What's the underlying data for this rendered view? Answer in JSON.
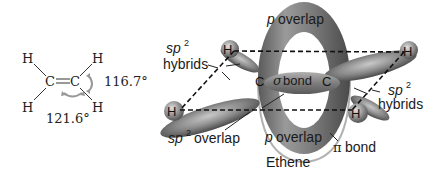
{
  "left_structure": {
    "atoms": {
      "h_top_left": "H",
      "h_top_right": "H",
      "h_bottom_left": "H",
      "h_bottom_right": "H",
      "c_left": "C",
      "c_right": "C"
    },
    "angle_hch": "116.7°",
    "angle_hcc": "121.6°"
  },
  "orbital_model": {
    "title": "Ethene",
    "labels": {
      "p_overlap_top": "overlap",
      "p_overlap_bottom": "overlap",
      "p_italic": "p",
      "sp2_italic": "sp",
      "sp2_sup": "2",
      "sp2_hybrids_left_word": "hybrids",
      "sp2_hybrids_right_word": "hybrids",
      "sp2_overlap_word": "overlap",
      "sigma_symbol": "σ",
      "sigma_word": "bond",
      "pi_symbol": "π",
      "pi_word": "bond"
    },
    "atoms": {
      "h_upper_left": "H",
      "h_upper_right": "H",
      "h_lower_left": "H",
      "h_lower_right": "H",
      "c_left": "C",
      "c_right": "C"
    }
  }
}
